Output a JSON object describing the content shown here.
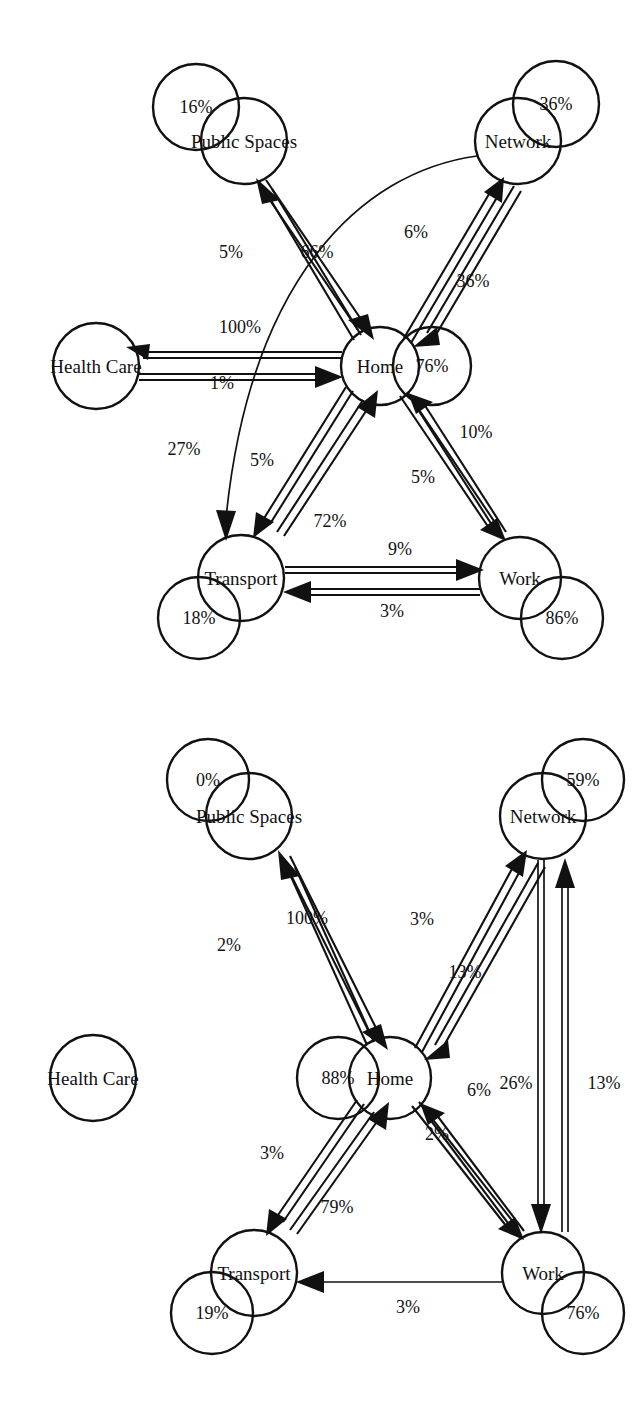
{
  "figure": {
    "title": "",
    "type": "state-transition-diagram-pair",
    "background": "#ffffff",
    "stroke_color": "#111111"
  },
  "diagrams": [
    {
      "id": "diagram-1",
      "name": "transition-diagram-top",
      "nodes": [
        {
          "id": "public_spaces",
          "label": "Public Spaces",
          "self_loop": "16%",
          "cx": 244,
          "cy": 141,
          "loop_cx": 196,
          "loop_cy": 107,
          "label_dx": 0,
          "label_dy": 0
        },
        {
          "id": "network",
          "label": "Network",
          "self_loop": "36%",
          "cx": 518,
          "cy": 141,
          "loop_cx": 556,
          "loop_cy": 104,
          "label_dx": 0,
          "label_dy": 0
        },
        {
          "id": "health_care",
          "label": "Health Care",
          "self_loop": null,
          "cx": 96,
          "cy": 366,
          "loop_cx": null,
          "loop_cy": null,
          "label_dx": 0,
          "label_dy": 0
        },
        {
          "id": "home",
          "label": "Home",
          "self_loop": "76%",
          "cx": 380,
          "cy": 366,
          "loop_cx": 432,
          "loop_cy": 366,
          "label_dx": 0,
          "label_dy": 0
        },
        {
          "id": "transport",
          "label": "Transport",
          "self_loop": "18%",
          "cx": 241,
          "cy": 578,
          "loop_cx": 199,
          "loop_cy": 618,
          "label_dx": 0,
          "label_dy": 0
        },
        {
          "id": "work",
          "label": "Work",
          "self_loop": "86%",
          "cx": 520,
          "cy": 578,
          "loop_cx": 562,
          "loop_cy": 618,
          "label_dx": 0,
          "label_dy": 0
        }
      ],
      "edges": [
        {
          "id": "home-to-public",
          "from": "home",
          "to": "public_spaces",
          "value": "5%",
          "lx": 231,
          "ly": 252
        },
        {
          "id": "public-to-home",
          "from": "public_spaces",
          "to": "home",
          "value": "66%",
          "lx": 317,
          "ly": 252
        },
        {
          "id": "home-to-network",
          "from": "home",
          "to": "network",
          "value": "6%",
          "lx": 416,
          "ly": 232
        },
        {
          "id": "network-to-home",
          "from": "network",
          "to": "home",
          "value": "36%",
          "lx": 473,
          "ly": 281
        },
        {
          "id": "home-to-health",
          "from": "home",
          "to": "health_care",
          "value": "100%",
          "lx": 240,
          "ly": 327
        },
        {
          "id": "health-to-home",
          "from": "health_care",
          "to": "home",
          "value": "1%",
          "lx": 222,
          "ly": 383
        },
        {
          "id": "network-to-transport",
          "from": "network",
          "to": "transport",
          "value": "27%",
          "lx": 184,
          "ly": 449
        },
        {
          "id": "home-to-transport",
          "from": "home",
          "to": "transport",
          "value": "5%",
          "lx": 262,
          "ly": 460
        },
        {
          "id": "transport-to-home",
          "from": "transport",
          "to": "home",
          "value": "72%",
          "lx": 330,
          "ly": 521
        },
        {
          "id": "home-to-work",
          "from": "home",
          "to": "work",
          "value": "5%",
          "lx": 423,
          "ly": 477
        },
        {
          "id": "work-to-home",
          "from": "work",
          "to": "home",
          "value": "10%",
          "lx": 476,
          "ly": 432
        },
        {
          "id": "transport-to-work",
          "from": "transport",
          "to": "work",
          "value": "9%",
          "lx": 400,
          "ly": 549
        },
        {
          "id": "work-to-transport",
          "from": "work",
          "to": "transport",
          "value": "3%",
          "lx": 392,
          "ly": 611
        }
      ]
    },
    {
      "id": "diagram-2",
      "name": "transition-diagram-bottom",
      "nodes": [
        {
          "id": "public_spaces",
          "label": "Public Spaces",
          "self_loop": "0%",
          "cx": 249,
          "cy": 116,
          "loop_cx": 208,
          "loop_cy": 80,
          "label_dx": 0,
          "label_dy": 0
        },
        {
          "id": "network",
          "label": "Network",
          "self_loop": "59%",
          "cx": 543,
          "cy": 116,
          "loop_cx": 583,
          "loop_cy": 80,
          "label_dx": 0,
          "label_dy": 0
        },
        {
          "id": "health_care",
          "label": "Health Care",
          "self_loop": null,
          "cx": 93,
          "cy": 378,
          "loop_cx": null,
          "loop_cy": null,
          "label_dx": 0,
          "label_dy": 0
        },
        {
          "id": "home",
          "label": "Home",
          "self_loop": "88%",
          "cx": 390,
          "cy": 378,
          "loop_cx": 338,
          "loop_cy": 378,
          "label_dx": 0,
          "label_dy": 0
        },
        {
          "id": "transport",
          "label": "Transport",
          "self_loop": "19%",
          "cx": 254,
          "cy": 573,
          "loop_cx": 212,
          "loop_cy": 613,
          "label_dx": 0,
          "label_dy": 0
        },
        {
          "id": "work",
          "label": "Work",
          "self_loop": "76%",
          "cx": 543,
          "cy": 573,
          "loop_cx": 583,
          "loop_cy": 613,
          "label_dx": 0,
          "label_dy": 0
        }
      ],
      "edges": [
        {
          "id": "home-to-public",
          "from": "home",
          "to": "public_spaces",
          "value": "2%",
          "lx": 229,
          "ly": 245
        },
        {
          "id": "public-to-home",
          "from": "public_spaces",
          "to": "home",
          "value": "100%",
          "lx": 307,
          "ly": 218
        },
        {
          "id": "home-to-network",
          "from": "home",
          "to": "network",
          "value": "3%",
          "lx": 422,
          "ly": 219
        },
        {
          "id": "network-to-home",
          "from": "network",
          "to": "home",
          "value": "13%",
          "lx": 465,
          "ly": 272
        },
        {
          "id": "network-to-work",
          "from": "network",
          "to": "work",
          "value": "26%",
          "lx": 516,
          "ly": 383
        },
        {
          "id": "work-to-network",
          "from": "work",
          "to": "network",
          "value": "13%",
          "lx": 604,
          "ly": 383
        },
        {
          "id": "home-to-transport",
          "from": "home",
          "to": "transport",
          "value": "3%",
          "lx": 272,
          "ly": 453
        },
        {
          "id": "transport-to-home",
          "from": "transport",
          "to": "home",
          "value": "79%",
          "lx": 337,
          "ly": 507
        },
        {
          "id": "home-to-work",
          "from": "home",
          "to": "work",
          "value": "2%",
          "lx": 437,
          "ly": 434
        },
        {
          "id": "work-to-home",
          "from": "work",
          "to": "home",
          "value": "6%",
          "lx": 479,
          "ly": 390
        },
        {
          "id": "work-to-transport",
          "from": "work",
          "to": "transport",
          "value": "3%",
          "lx": 408,
          "ly": 607
        }
      ]
    }
  ]
}
